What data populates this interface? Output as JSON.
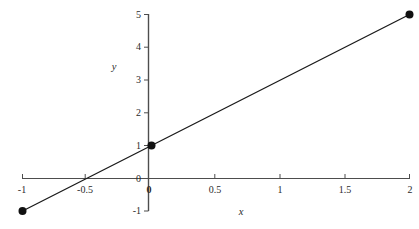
{
  "chart_data": {
    "type": "line",
    "title": "",
    "subtitle": "",
    "xlabel": "x",
    "ylabel": "y",
    "xlim": [
      -1,
      2
    ],
    "ylim": [
      -1,
      5
    ],
    "grid": false,
    "legend": null,
    "legend_position": "none",
    "line_color": "#1a1a1a",
    "axis_color": "#4d4d4d",
    "text_color": "#2b2b2b",
    "background_color": "#ffffff",
    "xticks": [
      {
        "value": -1,
        "label": "-1"
      },
      {
        "value": -0.5,
        "label": "-0.5"
      },
      {
        "value": 0,
        "label": "0"
      },
      {
        "value": 0.5,
        "label": "0.5"
      },
      {
        "value": 1,
        "label": "1"
      },
      {
        "value": 1.5,
        "label": "1.5"
      },
      {
        "value": 2,
        "label": "2"
      }
    ],
    "yticks": [
      {
        "value": -1,
        "label": "-1"
      },
      {
        "value": 0,
        "label": "0"
      },
      {
        "value": 1,
        "label": "1"
      },
      {
        "value": 2,
        "label": "2"
      },
      {
        "value": 3,
        "label": "3"
      },
      {
        "value": 4,
        "label": "4"
      },
      {
        "value": 5,
        "label": "5"
      }
    ],
    "series": [
      {
        "name": "y = 2x + 1",
        "x": [
          -1,
          2
        ],
        "y": [
          -1,
          5
        ]
      }
    ],
    "markers": [
      {
        "x": -1,
        "y": -1,
        "label": ""
      },
      {
        "x": 0,
        "y": 1,
        "label": ""
      },
      {
        "x": 2,
        "y": 5,
        "label": ""
      }
    ],
    "x_intercept": -0.5,
    "y_intercept": 1,
    "slope": 2
  }
}
